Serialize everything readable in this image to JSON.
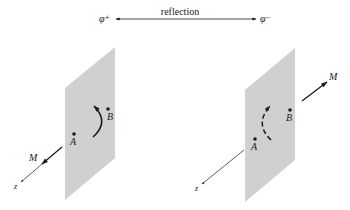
{
  "top": {
    "left_state": "φ⁺",
    "right_state": "φ⁻",
    "relation_label": "reflection"
  },
  "left_panel": {
    "point_a": "A",
    "point_b": "B",
    "moment_label": "M",
    "axis_label": "z",
    "arc_style": "solid",
    "moment_direction": "toward viewer (along +z)"
  },
  "right_panel": {
    "point_a": "A",
    "point_b": "B",
    "moment_label": "M",
    "axis_label": "z",
    "arc_style": "dashed",
    "moment_direction": "away from viewer (along -z)"
  },
  "colors": {
    "plane": "#d0d0d0",
    "ink": "#1a1a1a",
    "background": "#ffffff"
  }
}
